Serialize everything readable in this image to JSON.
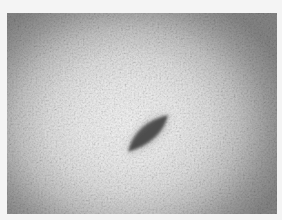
{
  "image": {
    "type": "grayscale micrograph",
    "subject": "spindle-shaped dark object",
    "colors": {
      "page_background": "#f4f4f4",
      "center_brightness": "#f3f3f3",
      "edge_vignette": "#858585",
      "object_fill": "#5a5a5a",
      "object_core": "#4a4a4a"
    },
    "frame": {
      "x": 7,
      "y": 13,
      "width": 270,
      "height": 201
    },
    "object": {
      "tip_lower_left": [
        128,
        152
      ],
      "tip_upper_right": [
        168,
        115
      ]
    }
  }
}
